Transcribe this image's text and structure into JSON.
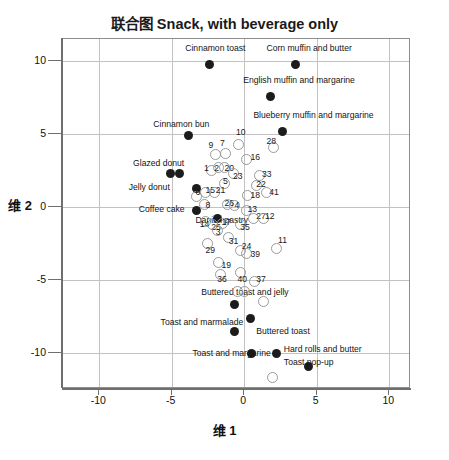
{
  "chart_data": {
    "type": "scatter",
    "title": "联合图 Snack, with beverage only",
    "xlabel": "维 1",
    "ylabel": "维 2",
    "xlim": [
      -12.5,
      11.5
    ],
    "ylim": [
      -12.5,
      11.5
    ],
    "xticks": [
      -10,
      -5,
      0,
      5,
      10
    ],
    "yticks": [
      10,
      5,
      0,
      -5,
      -10
    ],
    "xtick_labels": [
      "-10",
      "-5",
      "0",
      "5",
      "10"
    ],
    "ytick_labels": [
      "10",
      "5",
      "0",
      "-5",
      "-10"
    ],
    "grid": true,
    "legend": "none",
    "series": [
      {
        "name": "Snacks (labelled)",
        "marker": "filled-circle",
        "color": "#1c1c1c",
        "points": [
          {
            "label": "Cinnamon toast",
            "x": -2.3,
            "y": 9.7,
            "lx": -4.0,
            "ly": 10.8
          },
          {
            "label": "Corn muffin and butter",
            "x": 3.6,
            "y": 9.7,
            "lx": 1.6,
            "ly": 10.8
          },
          {
            "label": "English muffin and margarine",
            "x": 1.9,
            "y": 7.5,
            "lx": 0.0,
            "ly": 8.6
          },
          {
            "label": "Blueberry muffin and margarine",
            "x": 2.7,
            "y": 5.1,
            "lx": 0.7,
            "ly": 6.2
          },
          {
            "label": "Cinnamon bun",
            "x": -3.8,
            "y": 4.8,
            "lx": -6.2,
            "ly": 5.6
          },
          {
            "label": "Glazed donut",
            "x": -4.4,
            "y": 2.2,
            "lx": -7.6,
            "ly": 2.9
          },
          {
            "label": "Glazed donut b",
            "x": -5.0,
            "y": 2.2,
            "lx": null,
            "ly": null
          },
          {
            "label": "Jelly donut",
            "x": -3.2,
            "y": 1.2,
            "lx": -7.9,
            "ly": 1.3
          },
          {
            "label": "Coffee cake",
            "x": -3.2,
            "y": -0.3,
            "lx": -7.2,
            "ly": -0.2
          },
          {
            "label": "Danish pastry",
            "x": -1.8,
            "y": -0.9,
            "lx": -3.3,
            "ly": -1.0
          },
          {
            "label": "Buttered toast and jelly",
            "x": -0.6,
            "y": -6.8,
            "lx": -2.9,
            "ly": -5.9
          },
          {
            "label": "Toast and marmalade",
            "x": -0.6,
            "y": -8.6,
            "lx": -5.7,
            "ly": -8.0
          },
          {
            "label": "Buttered toast",
            "x": 0.5,
            "y": -7.7,
            "lx": 0.9,
            "ly": -8.6
          },
          {
            "label": "Toast and margarine",
            "x": 0.6,
            "y": -10.1,
            "lx": -3.5,
            "ly": -10.1
          },
          {
            "label": "Hard rolls and butter",
            "x": 2.3,
            "y": -10.1,
            "lx": 2.8,
            "ly": -9.8
          },
          {
            "label": "Toast pop-up",
            "x": 4.5,
            "y": -11.0,
            "lx": 2.8,
            "ly": -10.7
          }
        ]
      },
      {
        "name": "Attributes (numbered)",
        "marker": "open-circle",
        "color": "#9a9a9a",
        "points": [
          {
            "label": "10",
            "x": -0.3,
            "y": 4.2,
            "lx": -0.5,
            "ly": 5.0
          },
          {
            "label": "28",
            "x": 2.1,
            "y": 4.0,
            "lx": 1.6,
            "ly": 4.4
          },
          {
            "label": "9",
            "x": -1.9,
            "y": 3.5,
            "lx": -2.4,
            "ly": 4.1
          },
          {
            "label": "7",
            "x": -1.2,
            "y": 3.6,
            "lx": -1.6,
            "ly": 4.2
          },
          {
            "label": "16",
            "x": 0.2,
            "y": 3.2,
            "lx": 0.5,
            "ly": 3.3
          },
          {
            "label": "2",
            "x": -1.7,
            "y": 2.6,
            "lx": -2.0,
            "ly": 2.5
          },
          {
            "label": "20",
            "x": -1.3,
            "y": 2.6,
            "lx": -1.3,
            "ly": 2.5
          },
          {
            "label": "1",
            "x": -2.2,
            "y": 2.4,
            "lx": -2.7,
            "ly": 2.5
          },
          {
            "label": "23",
            "x": -0.7,
            "y": 2.2,
            "lx": -0.7,
            "ly": 2.0
          },
          {
            "label": "33",
            "x": 1.1,
            "y": 2.1,
            "lx": 1.3,
            "ly": 2.1
          },
          {
            "label": "5",
            "x": -1.3,
            "y": 1.5,
            "lx": -1.4,
            "ly": 1.6
          },
          {
            "label": "22",
            "x": 0.9,
            "y": 1.4,
            "lx": 0.9,
            "ly": 1.4
          },
          {
            "label": "15",
            "x": -2.6,
            "y": 0.9,
            "lx": -2.6,
            "ly": 1.0
          },
          {
            "label": "21",
            "x": -2.0,
            "y": 0.9,
            "lx": -1.9,
            "ly": 1.0
          },
          {
            "label": "18",
            "x": 0.3,
            "y": 0.7,
            "lx": 0.5,
            "ly": 0.7
          },
          {
            "label": "41",
            "x": 1.6,
            "y": 0.9,
            "lx": 1.8,
            "ly": 0.9
          },
          {
            "label": "6",
            "x": -3.2,
            "y": 0.6,
            "lx": -3.3,
            "ly": 0.9
          },
          {
            "label": "8",
            "x": -2.7,
            "y": 0.1,
            "lx": -2.6,
            "ly": 0.0
          },
          {
            "label": "26",
            "x": -1.1,
            "y": 0.1,
            "lx": -1.3,
            "ly": 0.1
          },
          {
            "label": "4",
            "x": -0.6,
            "y": 0.0,
            "lx": -0.6,
            "ly": 0.0
          },
          {
            "label": "13",
            "x": 0.2,
            "y": -0.3,
            "lx": 0.3,
            "ly": -0.3
          },
          {
            "label": "27",
            "x": 0.7,
            "y": -0.9,
            "lx": 0.9,
            "ly": -0.8
          },
          {
            "label": "12",
            "x": 1.4,
            "y": -0.9,
            "lx": 1.5,
            "ly": -0.8
          },
          {
            "label": "14",
            "x": -2.6,
            "y": -1.1,
            "lx": -3.0,
            "ly": -1.3
          },
          {
            "label": "25",
            "x": -2.1,
            "y": -1.3,
            "lx": -2.2,
            "ly": -1.5
          },
          {
            "label": "17",
            "x": -1.4,
            "y": -1.2,
            "lx": -1.5,
            "ly": -1.2
          },
          {
            "label": "3",
            "x": -1.8,
            "y": -1.7,
            "lx": -1.9,
            "ly": -1.9
          },
          {
            "label": "35",
            "x": -0.2,
            "y": -1.3,
            "lx": -0.2,
            "ly": -1.5
          },
          {
            "label": "31",
            "x": -1.0,
            "y": -2.2,
            "lx": -1.0,
            "ly": -2.5
          },
          {
            "label": "29",
            "x": -2.5,
            "y": -2.6,
            "lx": -2.6,
            "ly": -3.1
          },
          {
            "label": "24",
            "x": -0.2,
            "y": -3.1,
            "lx": -0.1,
            "ly": -2.8
          },
          {
            "label": "11",
            "x": 2.3,
            "y": -2.9,
            "lx": 2.4,
            "ly": -2.4
          },
          {
            "label": "39",
            "x": 0.2,
            "y": -3.3,
            "lx": 0.5,
            "ly": -3.4
          },
          {
            "label": "19",
            "x": -1.7,
            "y": -3.9,
            "lx": -1.5,
            "ly": -4.1
          },
          {
            "label": "36",
            "x": -1.6,
            "y": -4.7,
            "lx": -1.8,
            "ly": -5.1
          },
          {
            "label": "40",
            "x": -0.2,
            "y": -4.6,
            "lx": -0.4,
            "ly": -5.1
          },
          {
            "label": "37",
            "x": 0.8,
            "y": -5.2,
            "lx": 0.9,
            "ly": -5.1
          },
          {
            "label": "30",
            "x": -0.4,
            "y": -5.9,
            "lx": null,
            "ly": null
          },
          {
            "label": "32",
            "x": 0.1,
            "y": -5.9,
            "lx": null,
            "ly": null
          },
          {
            "label": "34",
            "x": 1.4,
            "y": -6.6,
            "lx": null,
            "ly": null
          },
          {
            "label": "38",
            "x": 2.0,
            "y": -11.8,
            "lx": null,
            "ly": null
          }
        ]
      }
    ]
  }
}
